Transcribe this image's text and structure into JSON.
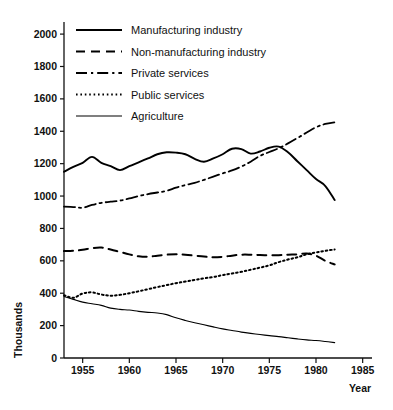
{
  "chart_data": {
    "type": "line",
    "title": "",
    "xlabel": "Year",
    "ylabel": "Thousands",
    "xlim": [
      1953,
      1986
    ],
    "ylim": [
      0,
      2050
    ],
    "xticks": [
      1955,
      1960,
      1965,
      1970,
      1975,
      1980,
      1985
    ],
    "xtick_labels": [
      "1955",
      "1960",
      "1965",
      "1970",
      "1975",
      "1980",
      "1985"
    ],
    "yticks": [
      0,
      200,
      400,
      600,
      800,
      1000,
      1200,
      1400,
      1600,
      1800,
      2000
    ],
    "ytick_labels": [
      "0",
      "200",
      "400",
      "600",
      "800",
      "1000",
      "1200",
      "1400",
      "1600",
      "1800",
      "2000"
    ],
    "grid": false,
    "legend_position": "upper-left-inside",
    "x": [
      1953,
      1954,
      1955,
      1956,
      1957,
      1958,
      1959,
      1960,
      1961,
      1962,
      1963,
      1964,
      1965,
      1966,
      1967,
      1968,
      1969,
      1970,
      1971,
      1972,
      1973,
      1974,
      1975,
      1976,
      1977,
      1978,
      1979,
      1980,
      1981,
      1982
    ],
    "series": [
      {
        "name": "Manufacturing industry",
        "line_style": "solid",
        "values": [
          1150,
          1180,
          1205,
          1242,
          1205,
          1185,
          1160,
          1185,
          1208,
          1232,
          1258,
          1270,
          1268,
          1258,
          1230,
          1212,
          1232,
          1258,
          1292,
          1290,
          1262,
          1275,
          1298,
          1305,
          1270,
          1215,
          1160,
          1105,
          1062,
          975
        ]
      },
      {
        "name": "Non-manufacturing industry",
        "line_style": "dashed",
        "values": [
          660,
          662,
          668,
          678,
          682,
          670,
          655,
          640,
          628,
          625,
          632,
          638,
          640,
          638,
          632,
          626,
          622,
          625,
          632,
          638,
          638,
          636,
          634,
          635,
          638,
          640,
          645,
          632,
          600,
          578
        ]
      },
      {
        "name": "Private services",
        "line_style": "dashdot",
        "values": [
          935,
          932,
          928,
          945,
          958,
          965,
          972,
          985,
          1000,
          1012,
          1022,
          1032,
          1052,
          1068,
          1082,
          1100,
          1120,
          1140,
          1158,
          1182,
          1212,
          1248,
          1272,
          1295,
          1325,
          1358,
          1392,
          1425,
          1445,
          1455
        ]
      },
      {
        "name": "Public services",
        "line_style": "dotted",
        "values": [
          388,
          372,
          398,
          405,
          392,
          385,
          390,
          400,
          412,
          425,
          438,
          450,
          462,
          472,
          482,
          492,
          500,
          512,
          522,
          532,
          545,
          558,
          572,
          592,
          608,
          622,
          640,
          652,
          662,
          670
        ]
      },
      {
        "name": "Agriculture",
        "line_style": "solid-thin",
        "values": [
          380,
          362,
          345,
          335,
          325,
          308,
          300,
          296,
          288,
          282,
          278,
          268,
          248,
          232,
          218,
          205,
          192,
          180,
          170,
          160,
          152,
          145,
          138,
          132,
          125,
          118,
          112,
          108,
          102,
          95
        ]
      }
    ]
  },
  "legend": {
    "items": [
      {
        "label": "Manufacturing industry",
        "style": "solid"
      },
      {
        "label": "Non-manufacturing industry",
        "style": "dashed"
      },
      {
        "label": "Private services",
        "style": "dashdot"
      },
      {
        "label": "Public services",
        "style": "dotted"
      },
      {
        "label": "Agriculture",
        "style": "solid-thin"
      }
    ]
  },
  "axes": {
    "y_title": "Thousands",
    "x_title": "Year"
  },
  "colors": {
    "ink": "#000000",
    "background": "#ffffff"
  }
}
